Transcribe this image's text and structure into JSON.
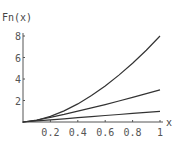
{
  "chart_data": {
    "type": "line",
    "title": "",
    "xlabel": "x",
    "ylabel": "Fn(x)",
    "xlim": [
      0,
      1
    ],
    "ylim": [
      0,
      8
    ],
    "grid": false,
    "legend": null,
    "x_ticks": [
      "0.2",
      "0.4",
      "0.6",
      "0.8",
      "1"
    ],
    "y_ticks": [
      "2",
      "4",
      "6",
      "8"
    ],
    "x": [
      0,
      0.1,
      0.2,
      0.3,
      0.4,
      0.5,
      0.6,
      0.7,
      0.8,
      0.9,
      1.0
    ],
    "series": [
      {
        "name": "curve-top",
        "values": [
          0,
          0.16,
          0.52,
          1.03,
          1.68,
          2.46,
          3.36,
          4.36,
          5.47,
          6.68,
          8.0
        ]
      },
      {
        "name": "curve-middle",
        "values": [
          0,
          0.19,
          0.44,
          0.71,
          1.01,
          1.31,
          1.62,
          1.95,
          2.29,
          2.64,
          3.0
        ]
      },
      {
        "name": "curve-bottom",
        "values": [
          0,
          0.1,
          0.2,
          0.3,
          0.4,
          0.5,
          0.6,
          0.7,
          0.8,
          0.9,
          1.0
        ]
      }
    ]
  },
  "axes": {
    "y_label": "Fn(x)",
    "x_label": "x"
  }
}
